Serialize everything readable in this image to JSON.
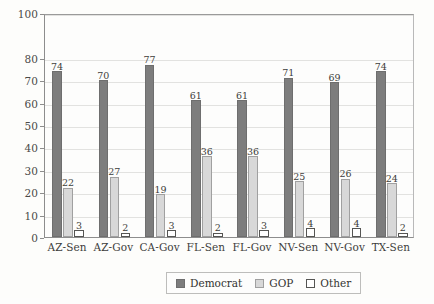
{
  "chart_data": {
    "type": "bar",
    "title": "",
    "subtitle": "",
    "xlabel": "",
    "ylabel": "",
    "ylim": [
      0,
      100
    ],
    "grid": true,
    "legend_position": "bottom-center",
    "y_ticks": [
      0,
      10,
      20,
      30,
      40,
      50,
      60,
      70,
      80,
      100
    ],
    "y_tick_labels": [
      "0",
      "10",
      "20",
      "30",
      "40",
      "50",
      "60",
      "70",
      "80",
      "100"
    ],
    "categories": [
      "AZ-Sen",
      "AZ-Gov",
      "CA-Gov",
      "FL-Sen",
      "FL-Gov",
      "NV-Sen",
      "NV-Gov",
      "TX-Sen"
    ],
    "series": [
      {
        "name": "Democrat",
        "color": "#7d7d7d",
        "values": [
          74,
          70,
          77,
          61,
          61,
          71,
          69,
          74
        ]
      },
      {
        "name": "GOP",
        "color": "#d8d8d8",
        "values": [
          22,
          27,
          19,
          36,
          36,
          25,
          26,
          24
        ]
      },
      {
        "name": "Other",
        "color": "#ffffff",
        "values": [
          3,
          2,
          3,
          2,
          3,
          4,
          4,
          2
        ]
      }
    ]
  },
  "legend": {
    "entries": [
      {
        "label": "Democrat",
        "swatch": "dem"
      },
      {
        "label": "GOP",
        "swatch": "gop"
      },
      {
        "label": "Other",
        "swatch": "oth"
      }
    ]
  }
}
